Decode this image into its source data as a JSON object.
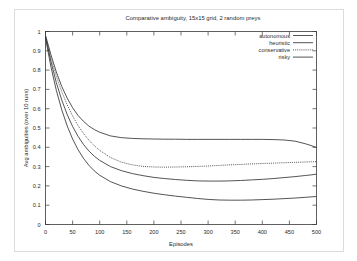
{
  "chart_data": {
    "type": "line",
    "title": "Comparative ambiguity, 15x15 grid, 2 random preys",
    "xlabel": "Episodes",
    "ylabel": "Avg ambiguities (over 10 runs)",
    "xlim": [
      0,
      500
    ],
    "ylim": [
      0,
      1
    ],
    "xticks": [
      0,
      50,
      100,
      150,
      200,
      250,
      300,
      350,
      400,
      450,
      500
    ],
    "xtick_labels": [
      "0",
      "50",
      "100",
      "150",
      "200",
      "250",
      "300",
      "350",
      "400",
      "450",
      "500"
    ],
    "yticks": [
      0,
      0.1,
      0.2,
      0.3,
      0.4,
      0.5,
      0.6,
      0.7,
      0.8,
      0.9,
      1
    ],
    "ytick_labels": [
      "0",
      "0.1",
      "0.2",
      "0.3",
      "0.4",
      "0.5",
      "0.6",
      "0.7",
      "0.8",
      "0.9",
      "1"
    ],
    "grid": false,
    "legend_position": "top-right",
    "x": [
      0,
      10,
      20,
      30,
      40,
      50,
      60,
      70,
      80,
      90,
      100,
      120,
      140,
      160,
      180,
      200,
      220,
      240,
      260,
      280,
      300,
      320,
      340,
      360,
      380,
      400,
      420,
      440,
      460,
      480,
      490,
      500
    ],
    "series": [
      {
        "name": "autonomous",
        "linestyle": "solid",
        "values": [
          0.98,
          0.88,
          0.79,
          0.715,
          0.655,
          0.605,
          0.565,
          0.535,
          0.51,
          0.492,
          0.478,
          0.459,
          0.45,
          0.446,
          0.444,
          0.443,
          0.442,
          0.442,
          0.441,
          0.441,
          0.441,
          0.441,
          0.441,
          0.441,
          0.441,
          0.441,
          0.44,
          0.438,
          0.432,
          0.418,
          0.409,
          0.399
        ]
      },
      {
        "name": "heuristic",
        "linestyle": "solid",
        "values": [
          0.975,
          0.845,
          0.735,
          0.645,
          0.57,
          0.508,
          0.457,
          0.415,
          0.381,
          0.354,
          0.332,
          0.3,
          0.279,
          0.264,
          0.253,
          0.244,
          0.238,
          0.233,
          0.229,
          0.226,
          0.225,
          0.225,
          0.226,
          0.228,
          0.231,
          0.234,
          0.238,
          0.243,
          0.248,
          0.254,
          0.257,
          0.261
        ]
      },
      {
        "name": "conservative",
        "linestyle": "dotted",
        "values": [
          0.97,
          0.862,
          0.768,
          0.688,
          0.62,
          0.562,
          0.513,
          0.472,
          0.437,
          0.408,
          0.384,
          0.347,
          0.323,
          0.309,
          0.301,
          0.298,
          0.297,
          0.298,
          0.299,
          0.301,
          0.303,
          0.306,
          0.309,
          0.311,
          0.314,
          0.316,
          0.318,
          0.32,
          0.322,
          0.324,
          0.325,
          0.326
        ]
      },
      {
        "name": "risky",
        "linestyle": "solid",
        "values": [
          0.965,
          0.818,
          0.695,
          0.594,
          0.511,
          0.443,
          0.388,
          0.343,
          0.307,
          0.278,
          0.255,
          0.222,
          0.2,
          0.184,
          0.172,
          0.162,
          0.154,
          0.147,
          0.141,
          0.135,
          0.13,
          0.127,
          0.126,
          0.126,
          0.127,
          0.129,
          0.131,
          0.134,
          0.137,
          0.141,
          0.143,
          0.145
        ]
      }
    ]
  },
  "legend": {
    "items": [
      {
        "label": "autonomous",
        "style": "solid"
      },
      {
        "label": "heuristic",
        "style": "solid"
      },
      {
        "label": "conservative",
        "style": "dotted"
      },
      {
        "label": "risky",
        "style": "solid"
      }
    ]
  }
}
